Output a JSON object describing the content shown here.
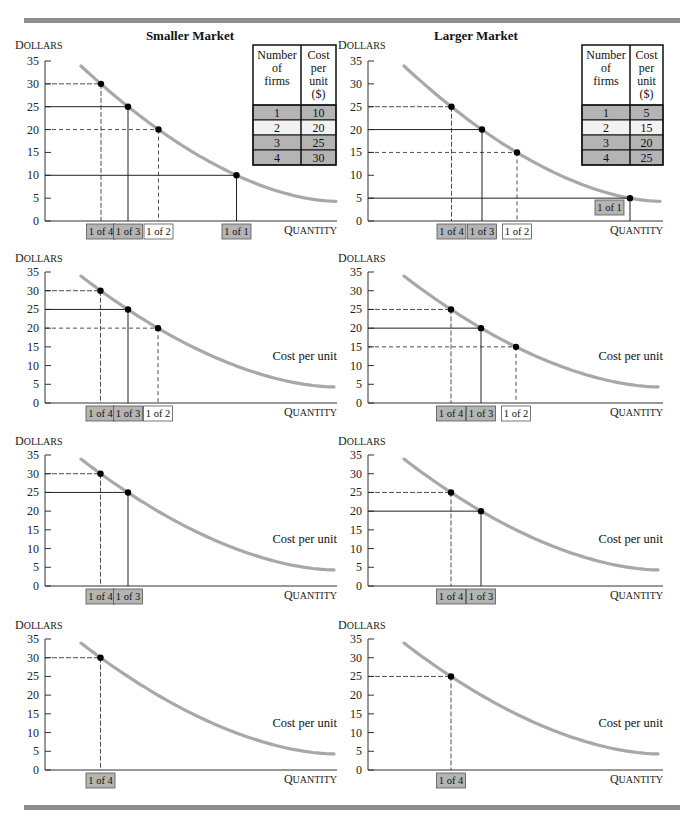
{
  "titles": {
    "left": "Smaller Market",
    "right": "Larger Market"
  },
  "axis": {
    "y_label_small_caps_first": "D",
    "y_label_rest": "OLLARS",
    "x_label_small_caps_first": "Q",
    "x_label_rest": "UANTITY",
    "y_ticks": [
      "35",
      "30",
      "25",
      "20",
      "15",
      "10",
      "5",
      "0"
    ]
  },
  "curve_label": "Cost per unit",
  "tables": {
    "headers": {
      "col1": [
        "Number",
        "of",
        "firms"
      ],
      "col2": [
        "Cost",
        "per",
        "unit",
        "($)"
      ]
    },
    "left": {
      "rows": [
        {
          "firms": "1",
          "cost": "10",
          "shade": "#b4b4b4"
        },
        {
          "firms": "2",
          "cost": "20",
          "shade": "#f2f2f2"
        },
        {
          "firms": "3",
          "cost": "25",
          "shade": "#b4b4b4"
        },
        {
          "firms": "4",
          "cost": "30",
          "shade": "#b4b4b4"
        }
      ]
    },
    "right": {
      "rows": [
        {
          "firms": "1",
          "cost": "5",
          "shade": "#b4b4b4"
        },
        {
          "firms": "2",
          "cost": "15",
          "shade": "#f2f2f2"
        },
        {
          "firms": "3",
          "cost": "20",
          "shade": "#b4b4b4"
        },
        {
          "firms": "4",
          "cost": "25",
          "shade": "#b4b4b4"
        }
      ]
    }
  },
  "colors": {
    "curve": "#a8a8a8",
    "rule": "#8e8e8e",
    "box_gray": "#b4b4b4",
    "box_white": "#ffffff"
  },
  "chart_data": [
    {
      "type": "line",
      "title": "Smaller Market",
      "panel": "row1-left",
      "xlabel": "Quantity",
      "ylabel": "Dollars",
      "ylim": [
        0,
        35
      ],
      "yticks": [
        0,
        5,
        10,
        15,
        20,
        25,
        30,
        35
      ],
      "series": [
        {
          "name": "Cost per unit",
          "description": "downward-sloping average cost curve"
        }
      ],
      "points": [
        {
          "label": "1 of 4",
          "y": 30,
          "shaded": true
        },
        {
          "label": "1 of 3",
          "y": 25,
          "shaded": true
        },
        {
          "label": "1 of 2",
          "y": 20,
          "shaded": false
        },
        {
          "label": "1 of 1",
          "y": 10,
          "shaded": true
        }
      ],
      "table": {
        "columns": [
          "Number of firms",
          "Cost per unit ($)"
        ],
        "rows": [
          [
            1,
            10
          ],
          [
            2,
            20
          ],
          [
            3,
            25
          ],
          [
            4,
            30
          ]
        ]
      }
    },
    {
      "type": "line",
      "title": "Larger Market",
      "panel": "row1-right",
      "xlabel": "Quantity",
      "ylabel": "Dollars",
      "ylim": [
        0,
        35
      ],
      "yticks": [
        0,
        5,
        10,
        15,
        20,
        25,
        30,
        35
      ],
      "series": [
        {
          "name": "Cost per unit",
          "description": "downward-sloping average cost curve"
        }
      ],
      "points": [
        {
          "label": "1 of 4",
          "y": 25,
          "shaded": true
        },
        {
          "label": "1 of 3",
          "y": 20,
          "shaded": true
        },
        {
          "label": "1 of 2",
          "y": 15,
          "shaded": false
        },
        {
          "label": "1 of 1",
          "y": 5,
          "shaded": true
        }
      ],
      "table": {
        "columns": [
          "Number of firms",
          "Cost per unit ($)"
        ],
        "rows": [
          [
            1,
            5
          ],
          [
            2,
            15
          ],
          [
            3,
            20
          ],
          [
            4,
            25
          ]
        ]
      }
    },
    {
      "type": "line",
      "panel": "row2-left",
      "xlabel": "Quantity",
      "ylabel": "Dollars",
      "ylim": [
        0,
        35
      ],
      "points": [
        {
          "label": "1 of 4",
          "y": 30,
          "shaded": true
        },
        {
          "label": "1 of 3",
          "y": 25,
          "shaded": true
        },
        {
          "label": "1 of 2",
          "y": 20,
          "shaded": false
        }
      ]
    },
    {
      "type": "line",
      "panel": "row2-right",
      "xlabel": "Quantity",
      "ylabel": "Dollars",
      "ylim": [
        0,
        35
      ],
      "points": [
        {
          "label": "1 of 4",
          "y": 25,
          "shaded": true
        },
        {
          "label": "1 of 3",
          "y": 20,
          "shaded": true
        },
        {
          "label": "1 of 2",
          "y": 15,
          "shaded": false
        }
      ]
    },
    {
      "type": "line",
      "panel": "row3-left",
      "xlabel": "Quantity",
      "ylabel": "Dollars",
      "ylim": [
        0,
        35
      ],
      "points": [
        {
          "label": "1 of 4",
          "y": 30,
          "shaded": true
        },
        {
          "label": "1 of 3",
          "y": 25,
          "shaded": true
        }
      ]
    },
    {
      "type": "line",
      "panel": "row3-right",
      "xlabel": "Quantity",
      "ylabel": "Dollars",
      "ylim": [
        0,
        35
      ],
      "points": [
        {
          "label": "1 of 4",
          "y": 25,
          "shaded": true
        },
        {
          "label": "1 of 3",
          "y": 20,
          "shaded": true
        }
      ]
    },
    {
      "type": "line",
      "panel": "row4-left",
      "xlabel": "Quantity",
      "ylabel": "Dollars",
      "ylim": [
        0,
        35
      ],
      "points": [
        {
          "label": "1 of 4",
          "y": 30,
          "shaded": true
        }
      ]
    },
    {
      "type": "line",
      "panel": "row4-right",
      "xlabel": "Quantity",
      "ylabel": "Dollars",
      "ylim": [
        0,
        35
      ],
      "points": [
        {
          "label": "1 of 4",
          "y": 25,
          "shaded": true
        }
      ]
    }
  ]
}
